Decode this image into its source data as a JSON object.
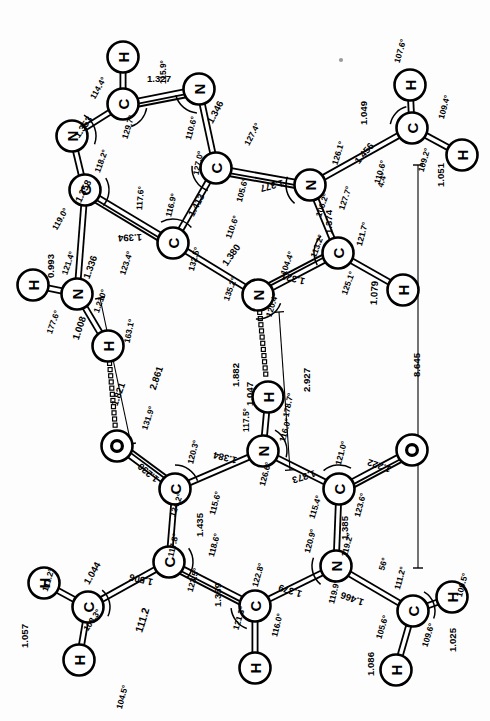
{
  "figure": {
    "units_bond": "Angstrom",
    "units_angle": "degree",
    "orientation_note": "diagram rotated; labels printed sideways"
  },
  "chart_data": {
    "type": "diagram",
    "xlabel": "",
    "ylabel": "",
    "atoms": [
      {
        "id": "A_H8",
        "element": "H",
        "x": 123,
        "y": 57
      },
      {
        "id": "A_C8",
        "element": "C",
        "x": 123,
        "y": 104
      },
      {
        "id": "A_N7",
        "element": "N",
        "x": 199,
        "y": 89
      },
      {
        "id": "A_N9",
        "element": "N",
        "x": 72,
        "y": 136
      },
      {
        "id": "A_C5",
        "element": "C",
        "x": 216,
        "y": 168
      },
      {
        "id": "A_C4",
        "element": "C",
        "x": 85,
        "y": 190
      },
      {
        "id": "A_C6",
        "element": "C",
        "x": 173,
        "y": 243
      },
      {
        "id": "A_N6",
        "element": "N",
        "x": 310,
        "y": 185
      },
      {
        "id": "A_N3",
        "element": "N",
        "x": 77,
        "y": 294
      },
      {
        "id": "A_H3a",
        "element": "H",
        "x": 33,
        "y": 285
      },
      {
        "id": "A_H3b",
        "element": "H",
        "x": 108,
        "y": 346
      },
      {
        "id": "A_C2",
        "element": "C",
        "x": 338,
        "y": 253
      },
      {
        "id": "A_H2",
        "element": "H",
        "x": 403,
        "y": 290
      },
      {
        "id": "A_N1",
        "element": "N",
        "x": 258,
        "y": 295
      },
      {
        "id": "A_CM",
        "element": "C",
        "x": 412,
        "y": 128
      },
      {
        "id": "A_HM1",
        "element": "H",
        "x": 410,
        "y": 85
      },
      {
        "id": "A_HM2",
        "element": "H",
        "x": 462,
        "y": 155
      },
      {
        "id": "T_O2",
        "element": "O",
        "x": 117,
        "y": 446
      },
      {
        "id": "T_C2",
        "element": "C",
        "x": 175,
        "y": 489
      },
      {
        "id": "T_N3",
        "element": "N",
        "x": 263,
        "y": 451
      },
      {
        "id": "T_H3",
        "element": "H",
        "x": 268,
        "y": 397
      },
      {
        "id": "T_C4",
        "element": "C",
        "x": 339,
        "y": 489
      },
      {
        "id": "T_O4",
        "element": "O",
        "x": 412,
        "y": 450
      },
      {
        "id": "T_C5",
        "element": "C",
        "x": 169,
        "y": 562
      },
      {
        "id": "T_N1",
        "element": "N",
        "x": 336,
        "y": 566
      },
      {
        "id": "T_C6",
        "element": "C",
        "x": 255,
        "y": 606
      },
      {
        "id": "T_H6",
        "element": "H",
        "x": 255,
        "y": 668
      },
      {
        "id": "T_CMe",
        "element": "C",
        "x": 88,
        "y": 607
      },
      {
        "id": "T_HMe1",
        "element": "H",
        "x": 44,
        "y": 583
      },
      {
        "id": "T_HMe2",
        "element": "H",
        "x": 79,
        "y": 660
      },
      {
        "id": "T_CMe2",
        "element": "C",
        "x": 413,
        "y": 611
      },
      {
        "id": "T_HN1",
        "element": "H",
        "x": 452,
        "y": 597
      },
      {
        "id": "T_HN2",
        "element": "H",
        "x": 396,
        "y": 670
      }
    ],
    "bonds": [
      {
        "from": "A_C8",
        "to": "A_H8",
        "order": 1,
        "length": "1.079x"
      },
      {
        "from": "A_C8",
        "to": "A_N7",
        "order": 2,
        "length": "1.327"
      },
      {
        "from": "A_C8",
        "to": "A_N9",
        "order": 1,
        "length": "1.353"
      },
      {
        "from": "A_N7",
        "to": "A_C5",
        "order": 1,
        "length": "1.346"
      },
      {
        "from": "A_N9",
        "to": "A_C4",
        "order": 1,
        "length": "1.358"
      },
      {
        "from": "A_C5",
        "to": "A_C6",
        "order": 1,
        "length": "1.413"
      },
      {
        "from": "A_C5",
        "to": "A_N6",
        "order": 2,
        "length": "1.377"
      },
      {
        "from": "A_C4",
        "to": "A_C6",
        "order": 2,
        "length": "1.394"
      },
      {
        "from": "A_C4",
        "to": "A_N3",
        "order": 1,
        "length": "1.336"
      },
      {
        "from": "A_N3",
        "to": "A_H3a",
        "order": 1,
        "length": "0.993"
      },
      {
        "from": "A_N3",
        "to": "A_H3b",
        "order": 1,
        "length": "1.008"
      },
      {
        "from": "A_C6",
        "to": "A_N1",
        "order": 1,
        "length": "1.380"
      },
      {
        "from": "A_N6",
        "to": "A_C2",
        "order": 1,
        "length": "1.374"
      },
      {
        "from": "A_N6",
        "to": "A_CM",
        "order": 1,
        "length": "1.456"
      },
      {
        "from": "A_C2",
        "to": "A_N1",
        "order": 2,
        "length": "1.321"
      },
      {
        "from": "A_C2",
        "to": "A_H2",
        "order": 1,
        "length": "1.079"
      },
      {
        "from": "A_CM",
        "to": "A_HM1",
        "order": 1,
        "length": "1.049"
      },
      {
        "from": "A_CM",
        "to": "A_HM2",
        "order": 1,
        "length": "1.051"
      },
      {
        "from": "T_C2",
        "to": "T_O2",
        "order": 2,
        "length": "1.230"
      },
      {
        "from": "T_C2",
        "to": "T_N3",
        "order": 1,
        "length": "1.384"
      },
      {
        "from": "T_C2",
        "to": "T_C5",
        "order": 1,
        "length": "1.435"
      },
      {
        "from": "T_N3",
        "to": "T_H3",
        "order": 1,
        "length": "1.047"
      },
      {
        "from": "T_N3",
        "to": "T_C4",
        "order": 1,
        "length": "1.373"
      },
      {
        "from": "T_C4",
        "to": "T_O4",
        "order": 2,
        "length": "1.222"
      },
      {
        "from": "T_C4",
        "to": "T_N1",
        "order": 1,
        "length": "1.385"
      },
      {
        "from": "T_C5",
        "to": "T_C6",
        "order": 2,
        "length": "1.359"
      },
      {
        "from": "T_C5",
        "to": "T_CMe",
        "order": 1,
        "length": "1.506"
      },
      {
        "from": "T_C6",
        "to": "T_N1",
        "order": 1,
        "length": "1.379"
      },
      {
        "from": "T_C6",
        "to": "T_H6",
        "order": 1,
        "length": "1.086x"
      },
      {
        "from": "T_N1",
        "to": "T_CMe2",
        "order": 1,
        "length": "1.466"
      },
      {
        "from": "T_CMe",
        "to": "T_HMe1",
        "order": 1,
        "length": "1.044"
      },
      {
        "from": "T_CMe",
        "to": "T_HMe2",
        "order": 1,
        "length": "1.057"
      },
      {
        "from": "T_CMe2",
        "to": "T_HN1",
        "order": 1,
        "length": "1.025"
      },
      {
        "from": "T_CMe2",
        "to": "T_HN2",
        "order": 1,
        "length": "1.086"
      }
    ],
    "hydrogen_bonds": [
      {
        "from": "A_H3b",
        "to": "T_O2",
        "length": "1.821"
      },
      {
        "from": "A_N1",
        "to": "T_H3",
        "length": "1.882"
      }
    ],
    "distance_measures": [
      {
        "label": "2.861",
        "note": "N3(A)...O2(T) heavy-atom distance"
      },
      {
        "label": "2.927",
        "note": "N1(A)...N3(T) heavy-atom distance"
      },
      {
        "label": "8.645",
        "note": "overall span C-methyl(A) to C-methyl(T)"
      }
    ],
    "bond_length_labels": [
      "1.327",
      "1.353",
      "1.346",
      "1.358",
      "1.413",
      "1.394",
      "1.377",
      "1.380",
      "1.336",
      "0.993",
      "1.008",
      "1.374",
      "1.321",
      "1.456",
      "1.049",
      "1.051",
      "1.079",
      "1.230",
      "1.384",
      "1.435",
      "1.373",
      "1.222",
      "1.385",
      "1.359",
      "1.379",
      "1.506",
      "1.466",
      "1.044",
      "1.057",
      "1.025",
      "1.086",
      "1.047"
    ],
    "bond_angle_labels": [
      "115.9°",
      "114.4°",
      "129.7°",
      "110.6°",
      "118.2°",
      "127.0°",
      "127.4°",
      "117.6°",
      "119.0°",
      "116.9°",
      "105.6°",
      "123.4°",
      "132.5°",
      "110.6°",
      "121.4°",
      "177.6°",
      "121.0°",
      "163.1°",
      "135.2°",
      "120.4°",
      "104.4°",
      "126.1°",
      "127.7°",
      "106.2°",
      "113.2°",
      "121.7°",
      "125.1°",
      "110.6°",
      "107.6°",
      "109.4°",
      "109.2°",
      "4.4°",
      "131.9°",
      "120.3°",
      "124.2°",
      "115.6°",
      "117.8°",
      "118.6°",
      "126.6°",
      "117.5°",
      "116.0°",
      "178.7°",
      "121.0°",
      "123.6°",
      "115.4°",
      "120.9°",
      "119.2°",
      "122.8°",
      "123.5°",
      "121.3°",
      "116.0°",
      "119.9°",
      "111.2°",
      "108.3°",
      "111.2°",
      "104.5°",
      "105.6°",
      "109.6°",
      "109.5°",
      "111.2°",
      "56°"
    ]
  },
  "labels": {
    "angles": [
      {
        "text": "115.9°",
        "x": 163,
        "y": 72,
        "rot": -90
      },
      {
        "text": "114.4°",
        "x": 98,
        "y": 88,
        "rot": -60
      },
      {
        "text": "129.7°",
        "x": 128,
        "y": 127,
        "rot": -73
      },
      {
        "text": "1.327",
        "x": 159,
        "y": 78,
        "rot": 0
      },
      {
        "text": "1.353",
        "x": 83,
        "y": 127,
        "rot": -55
      },
      {
        "text": "110.6°",
        "x": 191,
        "y": 128,
        "rot": -75
      },
      {
        "text": "1.346",
        "x": 215,
        "y": 112,
        "rot": -62
      },
      {
        "text": "118.2°",
        "x": 101,
        "y": 161,
        "rot": -70
      },
      {
        "text": "127.0°",
        "x": 198,
        "y": 163,
        "rot": -78
      },
      {
        "text": "127.4°",
        "x": 252,
        "y": 134,
        "rot": -62
      },
      {
        "text": "1.358",
        "x": 83,
        "y": 191,
        "rot": -63
      },
      {
        "text": "117.6°",
        "x": 140,
        "y": 198,
        "rot": -85
      },
      {
        "text": "1.413",
        "x": 196,
        "y": 205,
        "rot": -62
      },
      {
        "text": "1.377",
        "x": 272,
        "y": 186,
        "rot": -195
      },
      {
        "text": "105.6°",
        "x": 242,
        "y": 190,
        "rot": -75
      },
      {
        "text": "119.0°",
        "x": 60,
        "y": 219,
        "rot": -60
      },
      {
        "text": "116.9°",
        "x": 171,
        "y": 205,
        "rot": -76
      },
      {
        "text": "110.6°",
        "x": 232,
        "y": 227,
        "rot": -70
      },
      {
        "text": "1.394",
        "x": 130,
        "y": 238,
        "rot": -183
      },
      {
        "text": "123.4°",
        "x": 126,
        "y": 263,
        "rot": -72
      },
      {
        "text": "132.5°",
        "x": 194,
        "y": 259,
        "rot": -75
      },
      {
        "text": "1.380",
        "x": 231,
        "y": 255,
        "rot": -55
      },
      {
        "text": "1.336",
        "x": 90,
        "y": 267,
        "rot": -70
      },
      {
        "text": "121.4°",
        "x": 68,
        "y": 263,
        "rot": -71
      },
      {
        "text": "0.993",
        "x": 50,
        "y": 266,
        "rot": -90
      },
      {
        "text": "1.210°",
        "x": 100,
        "y": 301,
        "rot": -70
      },
      {
        "text": "177.6°",
        "x": 53,
        "y": 322,
        "rot": -70
      },
      {
        "text": "1.008",
        "x": 79,
        "y": 328,
        "rot": -72
      },
      {
        "text": "163.1°",
        "x": 129,
        "y": 331,
        "rot": -78
      },
      {
        "text": "135.2°",
        "x": 230,
        "y": 289,
        "rot": -70
      },
      {
        "text": "120.4°",
        "x": 272,
        "y": 305,
        "rot": -73
      },
      {
        "text": "104.4°",
        "x": 287,
        "y": 263,
        "rot": -70
      },
      {
        "text": "1.321",
        "x": 293,
        "y": 279,
        "rot": -166
      },
      {
        "text": "126.1°",
        "x": 338,
        "y": 153,
        "rot": -73
      },
      {
        "text": "1.456",
        "x": 364,
        "y": 153,
        "rot": -50
      },
      {
        "text": "110.6°",
        "x": 380,
        "y": 172,
        "rot": -74
      },
      {
        "text": "1.049",
        "x": 363,
        "y": 113,
        "rot": -90
      },
      {
        "text": "107.6°",
        "x": 400,
        "y": 51,
        "rot": -74
      },
      {
        "text": "109.4°",
        "x": 444,
        "y": 107,
        "rot": -75
      },
      {
        "text": "109.2°",
        "x": 424,
        "y": 160,
        "rot": -74
      },
      {
        "text": "1.051",
        "x": 440,
        "y": 175,
        "rot": -90
      },
      {
        "text": "4.4°",
        "x": 382,
        "y": 180,
        "rot": -73
      },
      {
        "text": "127.7°",
        "x": 345,
        "y": 198,
        "rot": -72
      },
      {
        "text": "106.2°",
        "x": 322,
        "y": 205,
        "rot": -71
      },
      {
        "text": "1.374",
        "x": 328,
        "y": 222,
        "rot": -90
      },
      {
        "text": "113.2°",
        "x": 317,
        "y": 246,
        "rot": -70
      },
      {
        "text": "121.7°",
        "x": 362,
        "y": 234,
        "rot": -75
      },
      {
        "text": "125.1°",
        "x": 348,
        "y": 283,
        "rot": -70
      },
      {
        "text": "1.079",
        "x": 374,
        "y": 293,
        "rot": -87
      },
      {
        "text": "8.645",
        "x": 416,
        "y": 365,
        "rot": -90
      },
      {
        "text": "2.861",
        "x": 156,
        "y": 378,
        "rot": -72
      },
      {
        "text": "1.821",
        "x": 118,
        "y": 394,
        "rot": -70
      },
      {
        "text": "131.9°",
        "x": 148,
        "y": 418,
        "rot": -72
      },
      {
        "text": "1.882",
        "x": 235,
        "y": 375,
        "rot": -90
      },
      {
        "text": "2.927",
        "x": 306,
        "y": 380,
        "rot": -90
      },
      {
        "text": "1.047",
        "x": 249,
        "y": 394,
        "rot": -90
      },
      {
        "text": "117.5°",
        "x": 246,
        "y": 420,
        "rot": -90
      },
      {
        "text": "178.7°",
        "x": 288,
        "y": 405,
        "rot": -78
      },
      {
        "text": "116.0°",
        "x": 285,
        "y": 430,
        "rot": -75
      },
      {
        "text": "120.3°",
        "x": 193,
        "y": 452,
        "rot": -76
      },
      {
        "text": "1.230",
        "x": 148,
        "y": 473,
        "rot": -140
      },
      {
        "text": "1.384",
        "x": 225,
        "y": 458,
        "rot": -166
      },
      {
        "text": "126.6°",
        "x": 265,
        "y": 474,
        "rot": -75
      },
      {
        "text": "1.373",
        "x": 304,
        "y": 477,
        "rot": -198
      },
      {
        "text": "121.0°",
        "x": 341,
        "y": 453,
        "rot": -75
      },
      {
        "text": "1.222",
        "x": 379,
        "y": 466,
        "rot": -162
      },
      {
        "text": "124.2°",
        "x": 176,
        "y": 505,
        "rot": -70
      },
      {
        "text": "115.6°",
        "x": 215,
        "y": 503,
        "rot": -75
      },
      {
        "text": "1.435",
        "x": 199,
        "y": 525,
        "rot": -90
      },
      {
        "text": "123.6°",
        "x": 360,
        "y": 505,
        "rot": -75
      },
      {
        "text": "115.4°",
        "x": 315,
        "y": 507,
        "rot": -72
      },
      {
        "text": "1.385",
        "x": 344,
        "y": 528,
        "rot": -90
      },
      {
        "text": "117.8°",
        "x": 173,
        "y": 545,
        "rot": -77
      },
      {
        "text": "118.6°",
        "x": 214,
        "y": 545,
        "rot": -75
      },
      {
        "text": "120.9°",
        "x": 310,
        "y": 541,
        "rot": -75
      },
      {
        "text": "119.2°",
        "x": 347,
        "y": 545,
        "rot": -75
      },
      {
        "text": "56°",
        "x": 383,
        "y": 564,
        "rot": -72
      },
      {
        "text": "111.2°",
        "x": 400,
        "y": 578,
        "rot": -75
      },
      {
        "text": "1.044",
        "x": 92,
        "y": 573,
        "rot": -60
      },
      {
        "text": "111.2°",
        "x": 48,
        "y": 580,
        "rot": -73
      },
      {
        "text": "1.506",
        "x": 141,
        "y": 580,
        "rot": -167
      },
      {
        "text": "108.3°",
        "x": 92,
        "y": 620,
        "rot": -56
      },
      {
        "text": "1.057",
        "x": 24,
        "y": 636,
        "rot": -90
      },
      {
        "text": "111.2",
        "x": 142,
        "y": 620,
        "rot": -73
      },
      {
        "text": "104.5°",
        "x": 122,
        "y": 697,
        "rot": -75
      },
      {
        "text": "123.5°",
        "x": 193,
        "y": 580,
        "rot": -74
      },
      {
        "text": "1.359",
        "x": 217,
        "y": 595,
        "rot": -90
      },
      {
        "text": "122.8°",
        "x": 258,
        "y": 575,
        "rot": -74
      },
      {
        "text": "1.379",
        "x": 290,
        "y": 591,
        "rot": -163
      },
      {
        "text": "119.9°",
        "x": 334,
        "y": 592,
        "rot": -76
      },
      {
        "text": "1.466",
        "x": 352,
        "y": 599,
        "rot": -160
      },
      {
        "text": "121.3°",
        "x": 239,
        "y": 618,
        "rot": -73
      },
      {
        "text": "116.0°",
        "x": 277,
        "y": 625,
        "rot": -76
      },
      {
        "text": "105.6°",
        "x": 382,
        "y": 627,
        "rot": -73
      },
      {
        "text": "109.6°",
        "x": 428,
        "y": 635,
        "rot": -73
      },
      {
        "text": "1.025",
        "x": 452,
        "y": 640,
        "rot": -90
      },
      {
        "text": "109.5°",
        "x": 462,
        "y": 585,
        "rot": -75
      },
      {
        "text": "1.086",
        "x": 370,
        "y": 664,
        "rot": -90
      }
    ]
  }
}
